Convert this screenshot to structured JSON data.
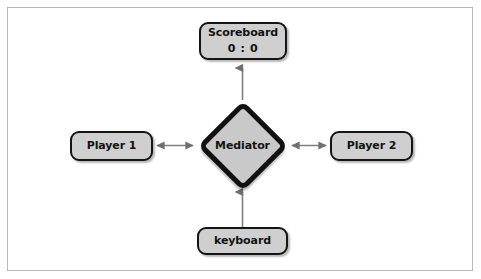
{
  "diagram": {
    "frame": {
      "border_color": "#b9b9b9",
      "background": "#ffffff"
    },
    "style": {
      "node_fill": "#cfcfcf",
      "node_border": "#141414",
      "mediator_fill": "#c9c9c9",
      "mediator_border": "#111111",
      "connector_color": "#808080",
      "text_color": "#121212"
    },
    "nodes": {
      "scoreboard": {
        "label": "Scoreboard",
        "score": "0 : 0",
        "shape": "rounded-rect"
      },
      "player1": {
        "label": "Player 1",
        "shape": "rounded-rect"
      },
      "player2": {
        "label": "Player 2",
        "shape": "rounded-rect"
      },
      "keyboard": {
        "label": "keyboard",
        "shape": "rounded-rect"
      },
      "mediator": {
        "label": "Mediator",
        "shape": "diamond"
      }
    },
    "connectors": [
      {
        "id": "mediator-to-scoreboard",
        "from": "mediator",
        "to": "scoreboard",
        "direction": "up",
        "arrowheads": "single"
      },
      {
        "id": "player1-mediator",
        "from": "player1",
        "to": "mediator",
        "direction": "horizontal",
        "arrowheads": "double"
      },
      {
        "id": "mediator-player2",
        "from": "mediator",
        "to": "player2",
        "direction": "horizontal",
        "arrowheads": "double"
      },
      {
        "id": "keyboard-to-mediator",
        "from": "keyboard",
        "to": "mediator",
        "direction": "up",
        "arrowheads": "single"
      }
    ]
  }
}
